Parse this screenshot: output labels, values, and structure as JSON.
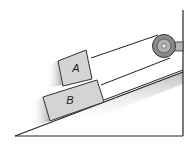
{
  "diagram": {
    "type": "physics-incline",
    "blocks": [
      {
        "id": "A",
        "label": "A",
        "position": "top"
      },
      {
        "id": "B",
        "label": "B",
        "position": "bottom"
      }
    ],
    "elements": [
      "inclined plane",
      "vertical wall",
      "pulley",
      "cable to block A",
      "cable to block B"
    ],
    "colors": {
      "block_fill": "#d4d4d4",
      "block_stroke": "#333333",
      "line": "#222222",
      "pulley_outer": "#8a8a8a",
      "pulley_inner": "#b5b5b5",
      "shadow": "#9a9a9a"
    }
  }
}
